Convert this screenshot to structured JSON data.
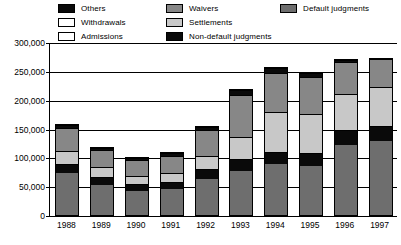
{
  "chart_data": {
    "type": "bar",
    "subtype": "stacked-bar",
    "title": "",
    "xlabel": "",
    "ylabel": "",
    "grid": true,
    "legend_position": "top",
    "ylim": [
      0,
      300000
    ],
    "yticks": [
      0,
      50000,
      100000,
      150000,
      200000,
      250000,
      300000
    ],
    "ytick_labels": [
      "0",
      "50,000",
      "100,000",
      "150,000",
      "200,000",
      "250,000",
      "300,000"
    ],
    "categories": [
      "1988",
      "1989",
      "1990",
      "1991",
      "1992",
      "1993",
      "1994",
      "1995",
      "1996",
      "1997"
    ],
    "stack_order_bottom_to_top": [
      "Default judgments",
      "Non-default judgments",
      "Settlements",
      "Waivers",
      "Others"
    ],
    "series": [
      {
        "name": "Default judgments",
        "color": "#6e6e6e",
        "values": [
          72000,
          52000,
          42000,
          45000,
          62000,
          77000,
          88000,
          85000,
          122000,
          128000
        ]
      },
      {
        "name": "Non-default judgments",
        "color": "#0a0a0a",
        "values": [
          17000,
          14000,
          12000,
          13000,
          17000,
          20000,
          22000,
          23000,
          26000,
          27000
        ]
      },
      {
        "name": "Settlements",
        "color": "#c8c8c8",
        "values": [
          22000,
          17000,
          14000,
          15000,
          23000,
          38000,
          68000,
          68000,
          62000,
          67000
        ]
      },
      {
        "name": "Waivers",
        "color": "#878787",
        "values": [
          40000,
          29000,
          27000,
          30000,
          45000,
          74000,
          68000,
          64000,
          56000,
          48000
        ]
      },
      {
        "name": "Others",
        "color": "#0a0a0a",
        "values": [
          6000,
          5000,
          4000,
          4000,
          6000,
          8000,
          9000,
          6000,
          3000,
          0
        ]
      },
      {
        "name": "Withdrawals",
        "color": "#ffffff",
        "values": [
          0,
          0,
          0,
          0,
          0,
          0,
          0,
          0,
          0,
          0
        ]
      },
      {
        "name": "Admissions",
        "color": "#ffffff",
        "values": [
          0,
          0,
          0,
          0,
          0,
          0,
          0,
          0,
          0,
          0
        ]
      }
    ],
    "totals": [
      157000,
      117000,
      99000,
      107000,
      153000,
      217000,
      255000,
      246000,
      269000,
      270000
    ]
  },
  "legend": {
    "columns": [
      {
        "items": [
          {
            "label": "Others",
            "swatch": "sw-others"
          },
          {
            "label": "Withdrawals",
            "swatch": "sw-withdrawals"
          },
          {
            "label": "Admissions",
            "swatch": "sw-admissions"
          }
        ]
      },
      {
        "items": [
          {
            "label": "Waivers",
            "swatch": "sw-waivers"
          },
          {
            "label": "Settlements",
            "swatch": "sw-settlements"
          },
          {
            "label": "Non-default judgments",
            "swatch": "sw-nondefault"
          }
        ]
      },
      {
        "items": [
          {
            "label": "Default judgments",
            "swatch": "sw-default"
          }
        ]
      }
    ]
  }
}
